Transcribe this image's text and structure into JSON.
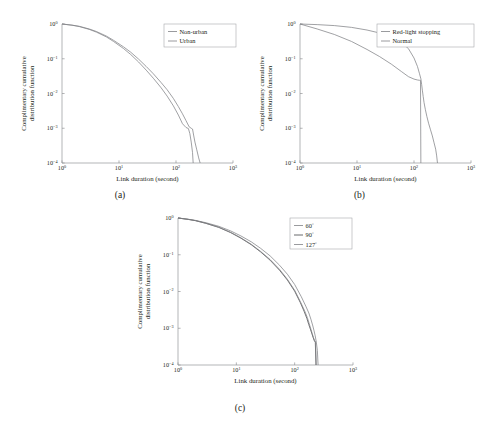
{
  "figure": {
    "background": "#ffffff",
    "line_color": "#808285",
    "line_color_dark": "#58595b",
    "axis_color": "#939598"
  },
  "common": {
    "xlabel": "Link duration (second)",
    "ylabel_line1": "Complimentary cumulative",
    "ylabel_line2": "distribution function",
    "x_ticklabels": [
      "10",
      "10",
      "10",
      "10"
    ],
    "x_tick_exponents": [
      "0",
      "1",
      "2",
      "3"
    ],
    "y_ticklabels": [
      "10",
      "10",
      "10",
      "10",
      "10"
    ],
    "y_tick_exponents": [
      "0",
      "−1",
      "−2",
      "−3",
      "−4"
    ]
  },
  "panels": [
    {
      "id": "a",
      "caption": "(a)"
    },
    {
      "id": "b",
      "caption": "(b)"
    },
    {
      "id": "c",
      "caption": "(c)"
    }
  ],
  "legend_a": {
    "items": [
      {
        "label": "Non-urban"
      },
      {
        "label": "Urban"
      }
    ]
  },
  "legend_b": {
    "items": [
      {
        "label": "Red-light stopping"
      },
      {
        "label": "Normal"
      }
    ]
  },
  "legend_c": {
    "items": [
      {
        "label": "60",
        "sup": "°"
      },
      {
        "label": "90",
        "sup": "°"
      },
      {
        "label": "127",
        "sup": "°"
      }
    ]
  },
  "chart_data": [
    {
      "type": "line",
      "panel": "(a)",
      "title": "",
      "xlabel": "Link duration (second)",
      "ylabel": "Complimentary cumulative distribution function",
      "xscale": "log",
      "yscale": "log",
      "xlim": [
        1,
        1000
      ],
      "ylim": [
        0.0001,
        1
      ],
      "grid": false,
      "legend_position": "upper-right",
      "series": [
        {
          "name": "Non-urban",
          "x": [
            1,
            1.5,
            2,
            3,
            4,
            6,
            8,
            12,
            16,
            22,
            30,
            40,
            55,
            70,
            90,
            110,
            130,
            150,
            170,
            185,
            195,
            205,
            215,
            230,
            250,
            265
          ],
          "y": [
            1.0,
            0.93,
            0.86,
            0.72,
            0.61,
            0.45,
            0.34,
            0.22,
            0.155,
            0.098,
            0.06,
            0.037,
            0.0205,
            0.0128,
            0.0072,
            0.0042,
            0.0026,
            0.00165,
            0.0011,
            0.001,
            0.00095,
            0.0006,
            0.0004,
            0.00025,
            0.00014,
            0.0001
          ]
        },
        {
          "name": "Urban",
          "x": [
            1,
            1.5,
            2,
            3,
            4,
            6,
            8,
            12,
            16,
            22,
            30,
            40,
            55,
            70,
            90,
            110,
            130,
            150,
            165,
            175,
            185,
            195,
            200
          ],
          "y": [
            1.0,
            0.92,
            0.845,
            0.7,
            0.585,
            0.425,
            0.315,
            0.197,
            0.133,
            0.081,
            0.047,
            0.0275,
            0.0145,
            0.0084,
            0.0044,
            0.0024,
            0.00135,
            0.00105,
            0.00098,
            0.0007,
            0.0004,
            0.0002,
            0.0001
          ]
        }
      ]
    },
    {
      "type": "line",
      "panel": "(b)",
      "title": "",
      "xlabel": "Link duration (second)",
      "ylabel": "Complimentary cumulative distribution function",
      "xscale": "log",
      "yscale": "log",
      "xlim": [
        1,
        1000
      ],
      "ylim": [
        0.0001,
        1
      ],
      "grid": false,
      "legend_position": "upper-right",
      "series": [
        {
          "name": "Red-light stopping",
          "x": [
            1,
            2,
            4,
            8,
            15,
            25,
            40,
            60,
            80,
            100,
            115,
            125,
            132,
            136,
            140,
            145,
            150,
            158,
            168,
            180,
            195,
            210,
            225,
            240,
            250,
            258
          ],
          "y": [
            1.0,
            0.96,
            0.9,
            0.8,
            0.67,
            0.55,
            0.42,
            0.295,
            0.195,
            0.105,
            0.06,
            0.037,
            0.0265,
            0.0185,
            0.0125,
            0.0082,
            0.0055,
            0.0035,
            0.0022,
            0.0014,
            0.0009,
            0.0006,
            0.00038,
            0.00025,
            0.00016,
            0.0001
          ]
        },
        {
          "name": "Normal",
          "x": [
            1,
            2,
            4,
            8,
            15,
            25,
            40,
            60,
            80,
            100,
            115,
            125,
            130,
            132
          ],
          "y": [
            1.0,
            0.72,
            0.5,
            0.315,
            0.185,
            0.115,
            0.07,
            0.043,
            0.0305,
            0.026,
            0.0245,
            0.024,
            0.0238,
            0.0001
          ]
        }
      ]
    },
    {
      "type": "line",
      "panel": "(c)",
      "title": "",
      "xlabel": "Link duration (second)",
      "ylabel": "Complimentary cumulative distribution function",
      "xscale": "log",
      "yscale": "log",
      "xlim": [
        1,
        1000
      ],
      "ylim": [
        0.0001,
        1
      ],
      "grid": false,
      "legend_position": "upper-right",
      "series": [
        {
          "name": "60°",
          "x": [
            1,
            1.5,
            2,
            3,
            5,
            8,
            12,
            18,
            26,
            38,
            55,
            75,
            100,
            130,
            155,
            175,
            190,
            205,
            215,
            225,
            235,
            245,
            252
          ],
          "y": [
            1.0,
            0.925,
            0.86,
            0.745,
            0.595,
            0.445,
            0.325,
            0.225,
            0.15,
            0.093,
            0.052,
            0.0295,
            0.0155,
            0.0072,
            0.004,
            0.0026,
            0.00175,
            0.00115,
            0.00085,
            0.00062,
            0.00042,
            0.00025,
            0.0001
          ]
        },
        {
          "name": "90°",
          "x": [
            1,
            1.5,
            2,
            3,
            5,
            8,
            12,
            18,
            26,
            38,
            55,
            75,
            100,
            125,
            145,
            162,
            175,
            188,
            198,
            208,
            218,
            226,
            232
          ],
          "y": [
            1.0,
            0.915,
            0.845,
            0.715,
            0.555,
            0.4,
            0.282,
            0.188,
            0.12,
            0.071,
            0.038,
            0.0205,
            0.0102,
            0.005,
            0.0029,
            0.00185,
            0.00125,
            0.0009,
            0.0007,
            0.00055,
            0.00045,
            0.00042,
            0.0001
          ]
        },
        {
          "name": "127°",
          "x": [
            1,
            1.5,
            2,
            3,
            5,
            8,
            12,
            18,
            26,
            38,
            55,
            75,
            100,
            125,
            148,
            165,
            178,
            190,
            200,
            210,
            220,
            228,
            234
          ],
          "y": [
            1.0,
            0.918,
            0.85,
            0.722,
            0.562,
            0.408,
            0.288,
            0.193,
            0.124,
            0.074,
            0.04,
            0.0215,
            0.0108,
            0.0053,
            0.003,
            0.00195,
            0.00132,
            0.00094,
            0.00072,
            0.00056,
            0.00046,
            0.00043,
            0.0001
          ]
        }
      ]
    }
  ]
}
